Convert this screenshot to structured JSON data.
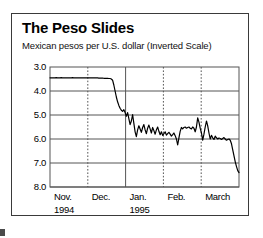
{
  "chart_data": {
    "type": "line",
    "title": "The Peso Slides",
    "subtitle": "Mexican pesos per U.S. dollar (Inverted Scale)",
    "xlabel": "",
    "ylabel": "",
    "inverted_y": true,
    "ylim": [
      3.0,
      8.0
    ],
    "yticks": [
      "3.0",
      "4.0",
      "5.0",
      "6.0",
      "7.0",
      "8.0"
    ],
    "ytick_values": [
      3.0,
      4.0,
      5.0,
      6.0,
      7.0,
      8.0
    ],
    "grid": "horizontal-solid-and-vertical-month-dividers",
    "legend": "none",
    "xticks": [
      {
        "label": "Nov.",
        "sublabel": "1994",
        "divider": "none"
      },
      {
        "label": "Dec.",
        "sublabel": "",
        "divider": "dotted"
      },
      {
        "label": "Jan.",
        "sublabel": "1995",
        "divider": "solid"
      },
      {
        "label": "Feb.",
        "sublabel": "",
        "divider": "dotted"
      },
      {
        "label": "March",
        "sublabel": "",
        "divider": "dotted"
      }
    ],
    "x_range_label": "Nov. 1994 through March 1995",
    "series": [
      {
        "name": "Mexican pesos per U.S. dollar",
        "color": "#000000",
        "values": [
          3.45,
          3.45,
          3.45,
          3.45,
          3.45,
          3.44,
          3.45,
          3.45,
          3.45,
          3.44,
          3.45,
          3.45,
          3.45,
          3.45,
          3.45,
          3.45,
          3.45,
          3.45,
          3.44,
          3.45,
          3.45,
          3.45,
          3.45,
          3.45,
          3.45,
          3.45,
          3.45,
          3.45,
          3.45,
          3.45,
          3.45,
          3.45,
          3.45,
          3.45,
          3.45,
          3.45,
          3.45,
          3.45,
          3.45,
          3.46,
          3.46,
          3.46,
          3.46,
          3.47,
          3.47,
          3.47,
          3.47,
          3.48,
          3.48,
          3.5,
          3.55,
          3.75,
          4.0,
          4.25,
          4.45,
          4.6,
          4.72,
          4.8,
          4.85,
          4.78,
          4.9,
          5.05,
          4.9,
          5.15,
          5.4,
          5.25,
          4.98,
          5.35,
          5.7,
          5.9,
          5.62,
          5.45,
          5.58,
          5.72,
          5.52,
          5.4,
          5.62,
          5.78,
          5.55,
          5.42,
          5.58,
          5.75,
          5.52,
          5.65,
          5.8,
          5.62,
          5.5,
          5.68,
          5.82,
          5.7,
          5.85,
          5.78,
          5.7,
          5.84,
          5.78,
          5.72,
          5.8,
          5.88,
          5.82,
          5.75,
          5.86,
          6.0,
          6.25,
          5.95,
          5.68,
          5.52,
          5.58,
          5.52,
          5.5,
          5.55,
          5.52,
          5.5,
          5.55,
          5.58,
          5.5,
          5.55,
          5.7,
          5.5,
          5.12,
          5.3,
          5.55,
          5.75,
          6.05,
          5.8,
          5.5,
          5.25,
          5.45,
          5.75,
          6.0,
          5.85,
          5.95,
          6.02,
          5.88,
          5.95,
          6.0,
          5.96,
          5.98,
          6.02,
          5.98,
          5.94,
          6.0,
          6.05,
          6.02,
          6.0,
          6.05,
          6.2,
          6.45,
          6.7,
          6.95,
          7.15,
          7.32,
          7.4
        ]
      }
    ]
  },
  "axis_geometry": {
    "plot_left_px": 38,
    "plot_right_px": 227,
    "plot_top_px": 53,
    "plot_bottom_px": 173
  }
}
